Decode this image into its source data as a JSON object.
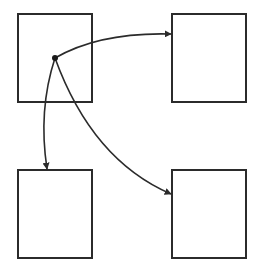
{
  "diagram": {
    "type": "node-link",
    "stroke_color": "#2b2b2b",
    "background_color": "#ffffff",
    "nodes": [
      {
        "id": "top-left",
        "label": ""
      },
      {
        "id": "top-right",
        "label": ""
      },
      {
        "id": "bottom-left",
        "label": ""
      },
      {
        "id": "bottom-right",
        "label": ""
      }
    ],
    "source_point": {
      "node": "top-left",
      "marker": "dot"
    },
    "edges": [
      {
        "from": "top-left",
        "to": "top-right",
        "style": "curved",
        "head": "arrow"
      },
      {
        "from": "top-left",
        "to": "bottom-left",
        "style": "curved",
        "head": "arrow"
      },
      {
        "from": "top-left",
        "to": "bottom-right",
        "style": "curved",
        "head": "arrow"
      }
    ]
  }
}
